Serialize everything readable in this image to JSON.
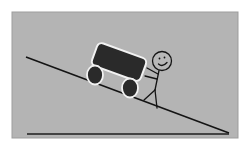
{
  "illustration": {
    "subject": "stick figure pushing cart up incline",
    "colors": {
      "page_background": "#ffffff",
      "panel_background": "#b4b4b4",
      "panel_border": "#9a9a9a",
      "line": "#141414",
      "cart_fill": "#2a2a2a",
      "cart_outline": "#f2f2f2",
      "figure_stroke": "#141414",
      "face_fill": "#b8b8b8"
    }
  }
}
